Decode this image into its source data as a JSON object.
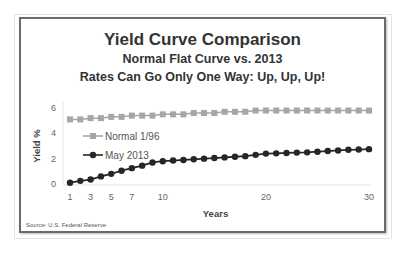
{
  "titles": {
    "main": "Yield Curve Comparison",
    "subtitle1": "Normal Flat Curve vs. 2013",
    "subtitle2": "Rates Can Go Only One Way: Up, Up, Up!"
  },
  "source": "Source: U.S. Federal Reserve",
  "colors": {
    "normal": "#a6a6a6",
    "may2013": "#262626",
    "frame": "#6a6a6a",
    "grid": "#e6e6e6"
  },
  "chart_data": {
    "type": "line",
    "title": "Yield Curve Comparison",
    "subtitle": [
      "Normal Flat Curve vs. 2013",
      "Rates Can Go Only One Way: Up, Up, Up!"
    ],
    "xlabel": "Years",
    "ylabel": "Yield %",
    "xlim": [
      1,
      30
    ],
    "ylim": [
      0,
      6
    ],
    "x_ticks": [
      1,
      3,
      5,
      7,
      10,
      20,
      30
    ],
    "y_ticks": [
      0,
      2,
      4,
      6
    ],
    "grid": false,
    "legend_position": "inside-left",
    "x": [
      1,
      2,
      3,
      4,
      5,
      6,
      7,
      8,
      9,
      10,
      11,
      12,
      13,
      14,
      15,
      16,
      17,
      18,
      19,
      20,
      21,
      22,
      23,
      24,
      25,
      26,
      27,
      28,
      29,
      30
    ],
    "series": [
      {
        "name": "Normal 1/96",
        "marker": "square",
        "color": "#a6a6a6",
        "values": [
          5.1,
          5.1,
          5.2,
          5.2,
          5.3,
          5.3,
          5.4,
          5.4,
          5.4,
          5.5,
          5.5,
          5.5,
          5.6,
          5.6,
          5.6,
          5.7,
          5.7,
          5.7,
          5.8,
          5.8,
          5.8,
          5.8,
          5.8,
          5.8,
          5.8,
          5.8,
          5.8,
          5.8,
          5.8,
          5.8
        ]
      },
      {
        "name": "May 2013",
        "marker": "circle",
        "color": "#262626",
        "values": [
          0.1,
          0.25,
          0.35,
          0.6,
          0.8,
          1.05,
          1.25,
          1.45,
          1.7,
          1.8,
          1.85,
          1.9,
          1.95,
          2.0,
          2.05,
          2.1,
          2.15,
          2.2,
          2.3,
          2.4,
          2.42,
          2.45,
          2.48,
          2.5,
          2.55,
          2.6,
          2.65,
          2.7,
          2.72,
          2.75
        ]
      }
    ]
  }
}
